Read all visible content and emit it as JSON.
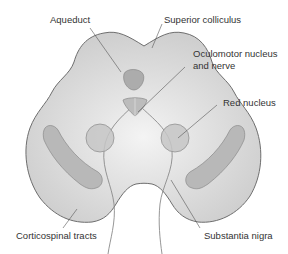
{
  "diagram": {
    "colors": {
      "background": "#ffffff",
      "tissue_fill": "#d2d2d2",
      "tissue_center": "#f2f2f2",
      "outline": "#6e6e6e",
      "structure_fill": "#b4b4b4",
      "red_nucleus_fill": "#c8c8c8",
      "leader_line": "#555555",
      "text": "#333333"
    },
    "labels": {
      "aqueduct": "Aqueduct",
      "superior_colliculus": "Superior colliculus",
      "oculomotor_line1": "Oculomotor nucleus",
      "oculomotor_line2": "and nerve",
      "red_nucleus": "Red nucleus",
      "corticospinal_tracts": "Corticospinal tracts",
      "substantia_nigra": "Substantia nigra"
    }
  }
}
